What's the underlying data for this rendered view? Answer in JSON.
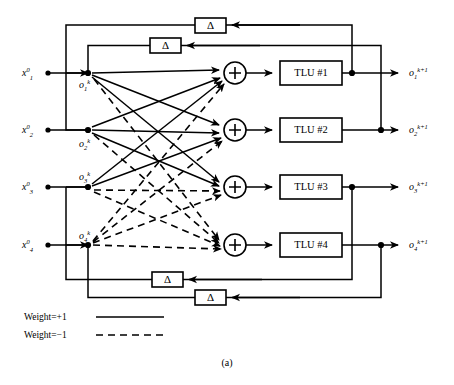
{
  "figure": {
    "caption": "(a)"
  },
  "inputs": [
    {
      "name": "input-1",
      "var": "x",
      "sub": "1",
      "sup": "0",
      "y": 73
    },
    {
      "name": "input-2",
      "var": "x",
      "sub": "2",
      "sup": "0",
      "y": 130
    },
    {
      "name": "input-3",
      "var": "x",
      "sub": "3",
      "sup": "0",
      "y": 187
    },
    {
      "name": "input-4",
      "var": "x",
      "sub": "4",
      "sup": "0",
      "y": 245
    }
  ],
  "nodes": [
    {
      "name": "node-o1",
      "var": "o",
      "sub": "1",
      "sup": "k",
      "y": 73
    },
    {
      "name": "node-o2",
      "var": "o",
      "sub": "2",
      "sup": "k",
      "y": 130
    },
    {
      "name": "node-o3",
      "var": "o",
      "sub": "3",
      "sup": "k",
      "y": 187
    },
    {
      "name": "node-o4",
      "var": "o",
      "sub": "4",
      "sup": "k",
      "y": 245
    }
  ],
  "outputs": [
    {
      "name": "output-1",
      "var": "o",
      "sub": "1",
      "sup": "k+1",
      "y": 73
    },
    {
      "name": "output-2",
      "var": "o",
      "sub": "2",
      "sup": "k+1",
      "y": 130
    },
    {
      "name": "output-3",
      "var": "o",
      "sub": "3",
      "sup": "k+1",
      "y": 187
    },
    {
      "name": "output-4",
      "var": "o",
      "sub": "4",
      "sup": "k+1",
      "y": 245
    }
  ],
  "summing_junctions": [
    {
      "name": "sum-junction-1",
      "symbol": "+",
      "cx": 235,
      "cy": 73
    },
    {
      "name": "sum-junction-2",
      "symbol": "+",
      "cx": 235,
      "cy": 130
    },
    {
      "name": "sum-junction-3",
      "symbol": "+",
      "cx": 235,
      "cy": 187
    },
    {
      "name": "sum-junction-4",
      "symbol": "+",
      "cx": 235,
      "cy": 245
    }
  ],
  "tlu_blocks": [
    {
      "name": "tlu-block-1",
      "label": "TLU #1",
      "x": 280,
      "y": 61,
      "w": 62,
      "h": 24
    },
    {
      "name": "tlu-block-2",
      "label": "TLU #2",
      "x": 280,
      "y": 118,
      "w": 62,
      "h": 24
    },
    {
      "name": "tlu-block-3",
      "label": "TLU #3",
      "x": 280,
      "y": 175,
      "w": 62,
      "h": 24
    },
    {
      "name": "tlu-block-4",
      "label": "TLU #4",
      "x": 280,
      "y": 233,
      "w": 62,
      "h": 24
    }
  ],
  "delay_blocks": [
    {
      "name": "delay-block-1",
      "label": "Δ",
      "x": 195,
      "y": 18,
      "w": 31,
      "h": 15
    },
    {
      "name": "delay-block-2",
      "label": "Δ",
      "x": 150,
      "y": 38,
      "w": 31,
      "h": 15
    },
    {
      "name": "delay-block-3",
      "label": "Δ",
      "x": 152,
      "y": 272,
      "w": 31,
      "h": 15
    },
    {
      "name": "delay-block-4",
      "label": "Δ",
      "x": 195,
      "y": 290,
      "w": 31,
      "h": 15
    }
  ],
  "legend": {
    "name": "weight-legend",
    "entries": [
      {
        "name": "legend-weight-positive",
        "label": "Weight=+1",
        "style": "solid",
        "value": 1
      },
      {
        "name": "legend-weight-negative",
        "label": "Weight=−1",
        "style": "dashed",
        "value": -1
      }
    ]
  },
  "weight_matrix": {
    "description": "Rows = source node o_i^k, Columns = destination summing junction j. +1 solid, -1 dashed.",
    "rows": [
      {
        "from": "o1",
        "to": [
          1,
          1,
          1,
          -1
        ]
      },
      {
        "from": "o2",
        "to": [
          1,
          1,
          1,
          -1
        ]
      },
      {
        "from": "o3",
        "to": [
          1,
          1,
          -1,
          -1
        ]
      },
      {
        "from": "o4",
        "to": [
          -1,
          -1,
          -1,
          -1
        ]
      }
    ]
  }
}
